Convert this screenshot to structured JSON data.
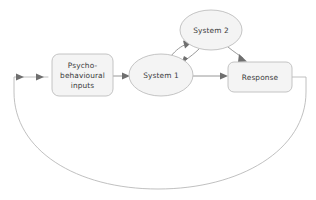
{
  "diagram": {
    "background_color": "#ffffff",
    "node_fill_color": "#f4f4f4",
    "node_stroke_color": "#bdbdbd",
    "edge_color": "#8d8d8d",
    "loop_edge_color": "#b0b0b0",
    "arrow_color": "#6f6f6f",
    "label_color": "#3a3a3a",
    "nodes": [
      {
        "id": "inputs",
        "shape": "rounded-rectangle",
        "label_lines": [
          "Psycho-",
          "behavioural",
          "inputs"
        ],
        "x": 52,
        "y": 54,
        "width": 61,
        "height": 42
      },
      {
        "id": "system1",
        "shape": "ellipse",
        "label_lines": [
          "System 1"
        ],
        "cx": 161,
        "cy": 75,
        "rx": 32,
        "ry": 21
      },
      {
        "id": "system2",
        "shape": "ellipse",
        "label_lines": [
          "System 2"
        ],
        "cx": 211,
        "cy": 30,
        "rx": 31,
        "ry": 20
      },
      {
        "id": "response",
        "shape": "rounded-rectangle",
        "label_lines": [
          "Response"
        ],
        "x": 228,
        "y": 62,
        "width": 64,
        "height": 30
      }
    ],
    "edges": [
      {
        "id": "inputs-to-system1",
        "from": "inputs",
        "to": "system1",
        "style": "straight",
        "arrowheads": 1
      },
      {
        "id": "system1-to-system2",
        "from": "system1",
        "to": "system2",
        "style": "curved",
        "arrowheads": 1
      },
      {
        "id": "system2-to-system1",
        "from": "system2",
        "to": "system1",
        "style": "curved",
        "arrowheads": 1
      },
      {
        "id": "system1-to-response",
        "from": "system1",
        "to": "response",
        "style": "straight",
        "arrowheads": 1
      },
      {
        "id": "system2-to-response",
        "from": "system2",
        "to": "response",
        "style": "curved",
        "arrowheads": 1
      },
      {
        "id": "response-feedback-to-inputs",
        "from": "response",
        "to": "inputs",
        "style": "large-bottom-arc",
        "arrowheads": 2
      }
    ]
  }
}
